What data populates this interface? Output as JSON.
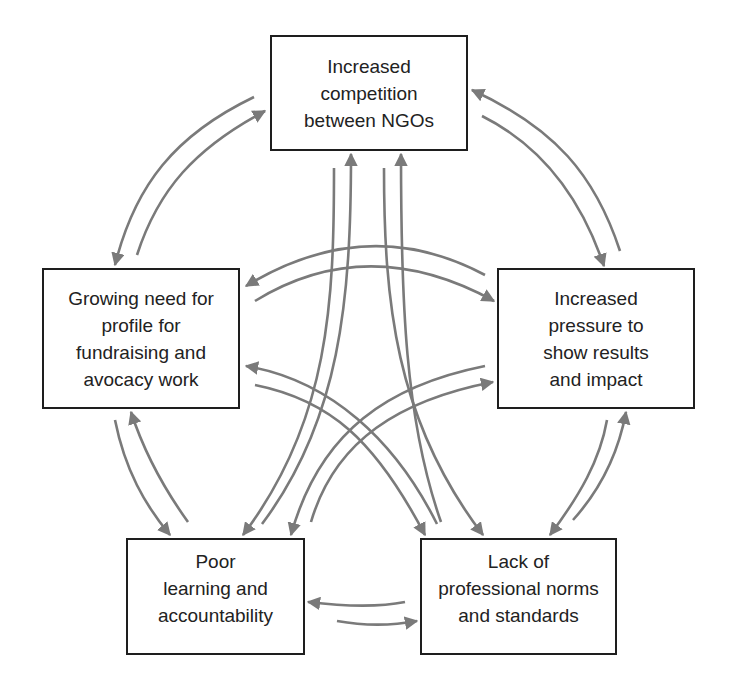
{
  "diagram": {
    "type": "cyclical causal loop diagram",
    "colors": {
      "box_border": "#1e1e1e",
      "arrow": "#7a7a7a",
      "text": "#222222",
      "background": "#ffffff"
    },
    "nodes": [
      {
        "id": "competition",
        "label": "Increased\ncompetition\nbetween NGOs"
      },
      {
        "id": "profile",
        "label": "Growing need for\nprofile for\nfundraising and\navocacy work"
      },
      {
        "id": "pressure",
        "label": "Increased\npressure to\nshow results\nand impact"
      },
      {
        "id": "learning",
        "label": "Poor\nlearning and\naccountability"
      },
      {
        "id": "norms",
        "label": "Lack of\nprofessional norms\nand standards"
      }
    ],
    "edges": [
      {
        "from": "competition",
        "to": "profile"
      },
      {
        "from": "profile",
        "to": "competition"
      },
      {
        "from": "competition",
        "to": "pressure"
      },
      {
        "from": "pressure",
        "to": "competition"
      },
      {
        "from": "profile",
        "to": "pressure"
      },
      {
        "from": "pressure",
        "to": "profile"
      },
      {
        "from": "profile",
        "to": "learning"
      },
      {
        "from": "learning",
        "to": "profile"
      },
      {
        "from": "pressure",
        "to": "norms"
      },
      {
        "from": "norms",
        "to": "pressure"
      },
      {
        "from": "learning",
        "to": "norms"
      },
      {
        "from": "norms",
        "to": "learning"
      },
      {
        "from": "competition",
        "to": "learning"
      },
      {
        "from": "learning",
        "to": "competition"
      },
      {
        "from": "competition",
        "to": "norms"
      },
      {
        "from": "norms",
        "to": "competition"
      },
      {
        "from": "profile",
        "to": "norms"
      },
      {
        "from": "norms",
        "to": "profile"
      },
      {
        "from": "pressure",
        "to": "learning"
      },
      {
        "from": "learning",
        "to": "pressure"
      }
    ]
  }
}
